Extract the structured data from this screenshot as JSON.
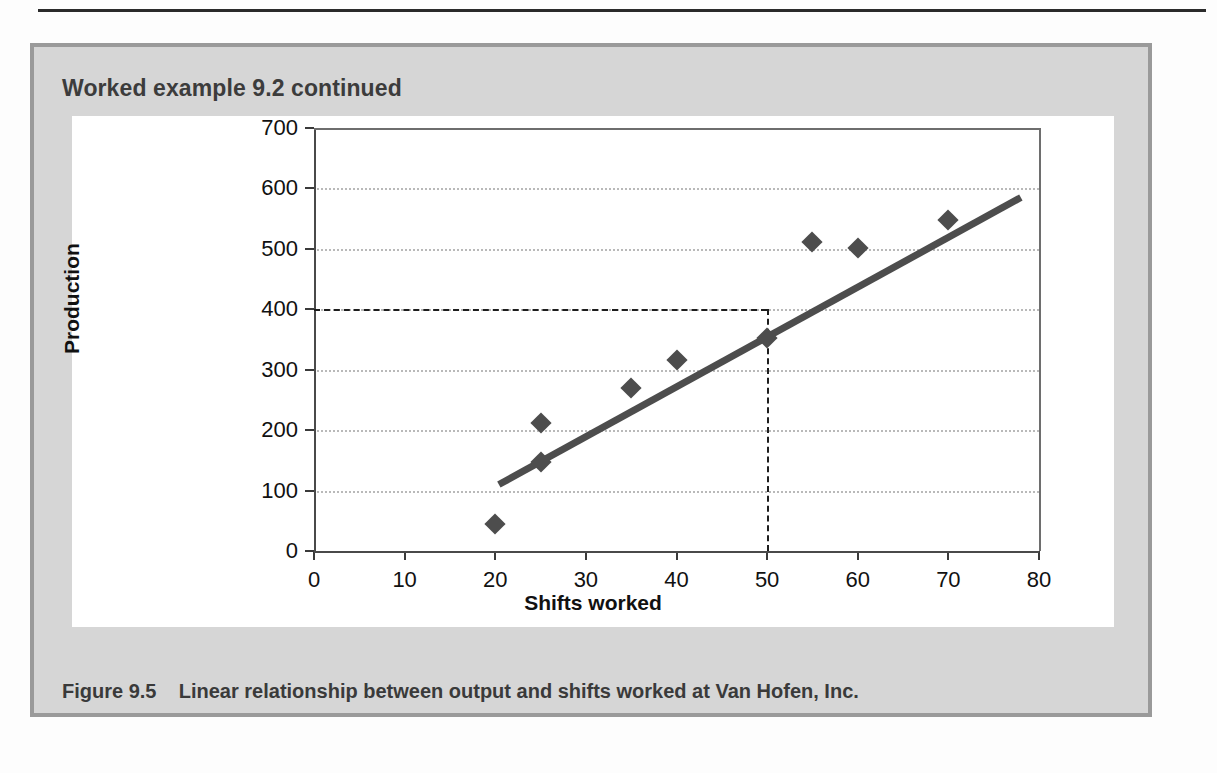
{
  "page": {
    "box_title": "Worked example 9.2 continued",
    "caption_label": "Figure 9.5",
    "caption_text": "Linear relationship between output and shifts worked at Van Hofen, Inc."
  },
  "colors": {
    "box_fill": "#d6d6d6",
    "box_border": "#9a9a9a",
    "chart_bg": "#ffffff",
    "marker": "#4d4d4d",
    "trendline": "#4d4d4d",
    "grid": "#b9b9b9",
    "axis": "#4a4a4a",
    "rule": "#2b2b2b",
    "text": "#3c3c3c"
  },
  "chart_data": {
    "type": "scatter",
    "title": "",
    "xlabel": "Shifts worked",
    "ylabel": "Production",
    "xlim": [
      0,
      80
    ],
    "ylim": [
      0,
      700
    ],
    "xticks": [
      0,
      10,
      20,
      30,
      40,
      50,
      60,
      70,
      80
    ],
    "yticks": [
      0,
      100,
      200,
      300,
      400,
      500,
      600,
      700
    ],
    "xtick_labels": [
      "0",
      "10",
      "20",
      "30",
      "40",
      "50",
      "60",
      "70",
      "80"
    ],
    "ytick_labels": [
      "0",
      "100",
      "200",
      "300",
      "400",
      "500",
      "600",
      "700"
    ],
    "grid": true,
    "grid_axis": "y",
    "legend": false,
    "series": [
      {
        "name": "Observations",
        "type": "scatter",
        "marker": "diamond",
        "points": [
          {
            "x": 20,
            "y": 45
          },
          {
            "x": 25,
            "y": 212
          },
          {
            "x": 25,
            "y": 148
          },
          {
            "x": 35,
            "y": 270
          },
          {
            "x": 40,
            "y": 316
          },
          {
            "x": 50,
            "y": 353
          },
          {
            "x": 55,
            "y": 512
          },
          {
            "x": 60,
            "y": 502
          },
          {
            "x": 70,
            "y": 548
          }
        ]
      },
      {
        "name": "Line of best fit",
        "type": "line",
        "endpoints": [
          {
            "x": 20.4,
            "y": 110
          },
          {
            "x": 78.0,
            "y": 585
          }
        ]
      }
    ],
    "annotations": [
      {
        "name": "reference-horizontal",
        "style": "dashed",
        "y": 400,
        "x_from": 0,
        "x_to": 50
      },
      {
        "name": "reference-vertical",
        "style": "dashed",
        "x": 50,
        "y_from": 0,
        "y_to": 400
      }
    ]
  }
}
